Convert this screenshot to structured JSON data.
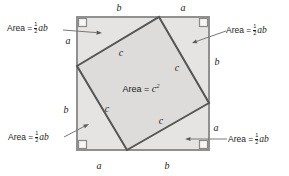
{
  "figure": {
    "description_type": "pythagorean-theorem-square-diagram",
    "triangle_area_label": {
      "prefix": "Area =",
      "fraction_numerator": "1",
      "fraction_denominator": "2",
      "variables": "ab"
    },
    "center_label": {
      "prefix": "Area = ",
      "base": "c",
      "exponent": "2"
    },
    "hypotenuse_label": "c",
    "edge_labels": {
      "top_left_segment": "b",
      "top_right_segment": "a",
      "left_top_segment": "a",
      "left_bottom_segment": "b",
      "right_top_segment": "b",
      "right_bottom_segment": "a",
      "bottom_left_segment": "a",
      "bottom_right_segment": "b"
    },
    "colors": {
      "outer_triangle_fill": "#e5e4e2",
      "inner_square_fill": "#dddcda",
      "outer_square_stroke": "#909090",
      "inner_square_stroke": "#555555",
      "leader_line": "#787878",
      "corner_marker_fill": "#f7f6f4"
    }
  }
}
